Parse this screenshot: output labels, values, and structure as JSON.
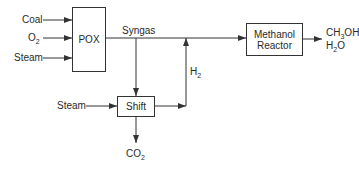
{
  "diagram": {
    "inputs": [
      {
        "label": "Coal"
      },
      {
        "label": "O",
        "sub": "2"
      },
      {
        "label": "Steam"
      }
    ],
    "blocks": {
      "pox": {
        "label": "POX"
      },
      "shift": {
        "label": "Shift"
      },
      "methanol_reactor": {
        "line1": "Methanol",
        "line2": "Reactor"
      }
    },
    "streams": {
      "syngas": "Syngas",
      "shift_steam": "Steam",
      "h2": {
        "label": "H",
        "sub": "2"
      },
      "co2": {
        "label": "CO",
        "sub": "2"
      }
    },
    "outputs": [
      {
        "pre": "CH",
        "sub": "3",
        "post": "OH"
      },
      {
        "pre": "H",
        "sub": "2",
        "post": "O"
      }
    ],
    "colors": {
      "line": "#333333",
      "text": "#2a2a2a",
      "background": "#ffffff"
    }
  }
}
